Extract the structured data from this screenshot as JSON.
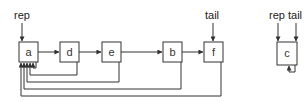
{
  "diagram": {
    "stroke_color": "#333333",
    "fill_color": "#ffffff",
    "set1": {
      "pointer_labels": {
        "rep": "rep",
        "tail": "tail"
      },
      "nodes": [
        {
          "id": "a",
          "label": "a"
        },
        {
          "id": "d",
          "label": "d"
        },
        {
          "id": "e",
          "label": "e"
        },
        {
          "id": "b",
          "label": "b"
        },
        {
          "id": "f",
          "label": "f"
        }
      ],
      "next_edges": [
        [
          "a",
          "d"
        ],
        [
          "d",
          "e"
        ],
        [
          "e",
          "b"
        ],
        [
          "b",
          "f"
        ]
      ],
      "rep_edges": [
        [
          "a",
          "a"
        ],
        [
          "d",
          "a"
        ],
        [
          "e",
          "a"
        ],
        [
          "b",
          "a"
        ],
        [
          "f",
          "a"
        ]
      ]
    },
    "set2": {
      "pointer_labels": {
        "rep": "rep",
        "tail": "tail"
      },
      "nodes": [
        {
          "id": "c",
          "label": "c"
        }
      ],
      "rep_edges": [
        [
          "c",
          "c"
        ]
      ]
    }
  }
}
